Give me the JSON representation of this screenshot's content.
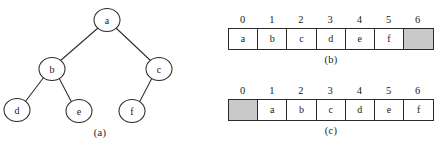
{
  "figure": {
    "parts": [
      "(a)",
      "(b)",
      "(c)"
    ]
  },
  "tree": {
    "caption": "(a)",
    "nodes": [
      {
        "id": "a",
        "label": "a",
        "cx": 107,
        "cy": 20,
        "rx": 13,
        "ry": 11.5
      },
      {
        "id": "b",
        "label": "b",
        "cx": 52,
        "cy": 69,
        "rx": 13,
        "ry": 11.5
      },
      {
        "id": "c",
        "label": "c",
        "cx": 159,
        "cy": 69,
        "rx": 13,
        "ry": 11.5
      },
      {
        "id": "d",
        "label": "d",
        "cx": 17,
        "cy": 110,
        "rx": 13,
        "ry": 11.5
      },
      {
        "id": "e",
        "label": "e",
        "cx": 79,
        "cy": 111,
        "rx": 13,
        "ry": 11.5
      },
      {
        "id": "f",
        "label": "f",
        "cx": 132,
        "cy": 111,
        "rx": 13,
        "ry": 11.5
      }
    ],
    "edges": [
      {
        "from": "a",
        "to": "b",
        "x1": 98,
        "y1": 28,
        "x2": 60,
        "y2": 61
      },
      {
        "from": "a",
        "to": "c",
        "x1": 116,
        "y1": 28,
        "x2": 151,
        "y2": 61
      },
      {
        "from": "b",
        "to": "d",
        "x1": 44,
        "y1": 77,
        "x2": 25,
        "y2": 102
      },
      {
        "from": "b",
        "to": "e",
        "x1": 59,
        "y1": 78,
        "x2": 72,
        "y2": 103
      },
      {
        "from": "c",
        "to": "f",
        "x1": 152,
        "y1": 78,
        "x2": 139,
        "y2": 103
      }
    ]
  },
  "array_b": {
    "caption": "(b)",
    "indices": [
      "0",
      "1",
      "2",
      "3",
      "4",
      "5",
      "6"
    ],
    "values": [
      "a",
      "b",
      "c",
      "d",
      "e",
      "f",
      ""
    ],
    "shaded": [
      false,
      false,
      false,
      false,
      false,
      false,
      true
    ]
  },
  "array_c": {
    "caption": "(c)",
    "indices": [
      "0",
      "1",
      "2",
      "3",
      "4",
      "5",
      "6"
    ],
    "values": [
      "",
      "a",
      "b",
      "c",
      "d",
      "e",
      "f"
    ],
    "shaded": [
      true,
      false,
      false,
      false,
      false,
      false,
      false
    ]
  },
  "colors": {
    "stroke": "#2b2b2b",
    "shaded_fill": "#c9c9c9",
    "background": "#ffffff",
    "text": "#1a1a1a"
  }
}
